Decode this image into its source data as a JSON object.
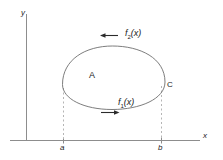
{
  "figure": {
    "axes": {
      "x_label": "x",
      "y_label": "y",
      "x_axis_color": "#8d8d8d",
      "y_axis_color": "#8d8d8d"
    },
    "ticks": [
      {
        "name": "a",
        "label": "a",
        "x": 63
      },
      {
        "name": "b",
        "label": "b",
        "x": 161
      }
    ],
    "region": {
      "label": "A",
      "curve_color": "#6e6e6e"
    },
    "curves": [
      {
        "name": "lower-boundary",
        "label": "f",
        "subscript": "1",
        "arg": "(x)",
        "full_label": "f₁(x)",
        "direction": "right"
      },
      {
        "name": "upper-boundary",
        "label": "f",
        "subscript": "2",
        "arg": "(x)",
        "full_label": "f₂(x)",
        "direction": "left"
      }
    ],
    "point": {
      "label": "C"
    },
    "guides": {
      "style": "dashed",
      "color": "#b5b5b5"
    }
  }
}
